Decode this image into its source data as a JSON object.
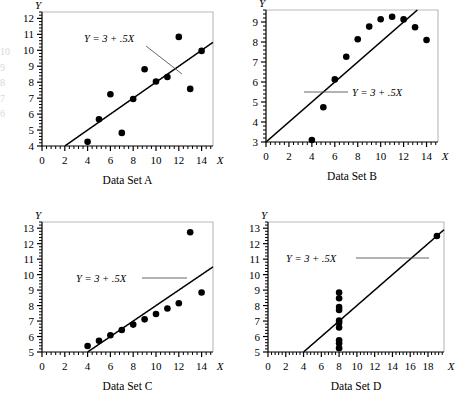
{
  "figure": {
    "equation_label": "Y = 3 + .5X",
    "axis_x_name": "X",
    "axis_y_name": "Y"
  },
  "panels": [
    {
      "id": "A",
      "caption": "Data Set A",
      "xlabels": [
        "0",
        "2",
        "4",
        "6",
        "8",
        "10",
        "12",
        "14"
      ],
      "ylabels": [
        "4",
        "5",
        "6",
        "7",
        "8",
        "9",
        "10",
        "11",
        "12"
      ]
    },
    {
      "id": "B",
      "caption": "Data Set B",
      "xlabels": [
        "0",
        "2",
        "4",
        "6",
        "8",
        "10",
        "12",
        "14"
      ],
      "ylabels": [
        "3",
        "4",
        "5",
        "6",
        "7",
        "8",
        "9"
      ]
    },
    {
      "id": "C",
      "caption": "Data Set C",
      "xlabels": [
        "0",
        "2",
        "4",
        "6",
        "8",
        "10",
        "12",
        "14"
      ],
      "ylabels": [
        "5",
        "6",
        "7",
        "8",
        "9",
        "10",
        "11",
        "12",
        "13"
      ]
    },
    {
      "id": "D",
      "caption": "Data Set D",
      "xlabels": [
        "0",
        "2",
        "4",
        "6",
        "8",
        "10",
        "12",
        "14",
        "16",
        "18"
      ],
      "ylabels": [
        "5",
        "6",
        "7",
        "8",
        "9",
        "10",
        "11",
        "12",
        "13"
      ]
    }
  ],
  "chart_data": [
    {
      "type": "scatter",
      "title": "Data Set A",
      "xlabel": "X",
      "ylabel": "Y",
      "xlim": [
        0,
        15
      ],
      "ylim": [
        4,
        12.4
      ],
      "xticks": [
        0,
        2,
        4,
        6,
        8,
        10,
        12,
        14
      ],
      "yticks": [
        4,
        5,
        6,
        7,
        8,
        9,
        10,
        11,
        12
      ],
      "grid": false,
      "legend": false,
      "annotation": "Y = 3 + .5X",
      "line": {
        "intercept": 3,
        "slope": 0.5
      },
      "x": [
        10.0,
        8.0,
        13.0,
        9.0,
        11.0,
        14.0,
        6.0,
        4.0,
        12.0,
        7.0,
        5.0
      ],
      "y": [
        8.04,
        6.95,
        7.58,
        8.81,
        8.33,
        9.96,
        7.24,
        4.26,
        10.84,
        4.82,
        5.68
      ]
    },
    {
      "type": "scatter",
      "title": "Data Set B",
      "xlabel": "X",
      "ylabel": "Y",
      "xlim": [
        0,
        15
      ],
      "ylim": [
        3,
        9.6
      ],
      "xticks": [
        0,
        2,
        4,
        6,
        8,
        10,
        12,
        14
      ],
      "yticks": [
        3,
        4,
        5,
        6,
        7,
        8,
        9
      ],
      "grid": false,
      "legend": false,
      "annotation": "Y = 3 + .5X",
      "line": {
        "intercept": 3,
        "slope": 0.5
      },
      "x": [
        10.0,
        8.0,
        13.0,
        9.0,
        11.0,
        14.0,
        6.0,
        4.0,
        12.0,
        7.0,
        5.0
      ],
      "y": [
        9.14,
        8.14,
        8.74,
        8.77,
        9.26,
        8.1,
        6.13,
        3.1,
        9.13,
        7.26,
        4.74
      ]
    },
    {
      "type": "scatter",
      "title": "Data Set C",
      "xlabel": "X",
      "ylabel": "Y",
      "xlim": [
        0,
        15
      ],
      "ylim": [
        5,
        13.4
      ],
      "xticks": [
        0,
        2,
        4,
        6,
        8,
        10,
        12,
        14
      ],
      "yticks": [
        5,
        6,
        7,
        8,
        9,
        10,
        11,
        12,
        13
      ],
      "grid": false,
      "legend": false,
      "annotation": "Y = 3 + .5X",
      "line": {
        "intercept": 3,
        "slope": 0.5
      },
      "x": [
        10.0,
        8.0,
        13.0,
        9.0,
        11.0,
        14.0,
        6.0,
        4.0,
        12.0,
        7.0,
        5.0
      ],
      "y": [
        7.46,
        6.77,
        12.74,
        7.11,
        7.81,
        8.84,
        6.08,
        5.39,
        8.15,
        6.42,
        5.73
      ]
    },
    {
      "type": "scatter",
      "title": "Data Set D",
      "xlabel": "X",
      "ylabel": "Y",
      "xlim": [
        0,
        19.8
      ],
      "ylim": [
        5,
        13.4
      ],
      "xticks": [
        0,
        2,
        4,
        6,
        8,
        10,
        12,
        14,
        16,
        18
      ],
      "yticks": [
        5,
        6,
        7,
        8,
        9,
        10,
        11,
        12,
        13
      ],
      "grid": false,
      "legend": false,
      "annotation": "Y = 3 + .5X",
      "line": {
        "intercept": 3,
        "slope": 0.5
      },
      "x": [
        8.0,
        8.0,
        8.0,
        8.0,
        8.0,
        8.0,
        8.0,
        19.0,
        8.0,
        8.0,
        8.0
      ],
      "y": [
        6.58,
        5.76,
        7.71,
        8.84,
        8.47,
        7.04,
        5.25,
        12.5,
        5.56,
        7.91,
        6.89
      ]
    }
  ]
}
